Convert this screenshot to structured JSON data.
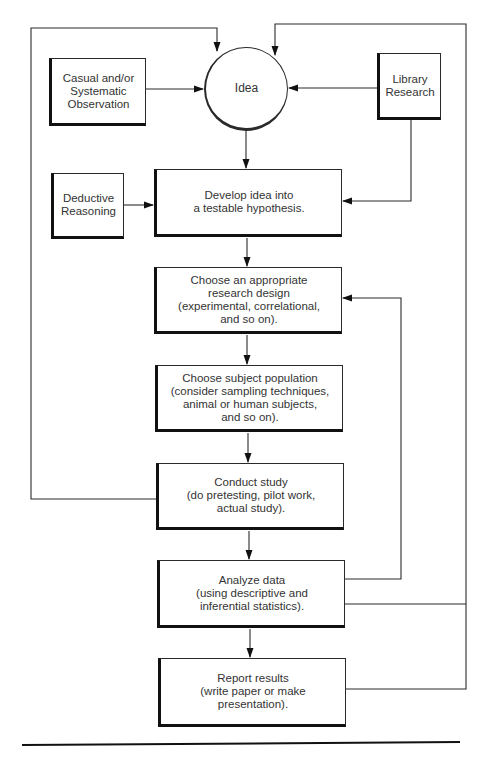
{
  "diagram": {
    "nodes": {
      "observation": {
        "label": "Casual and/or\nSystematic\nObservation"
      },
      "idea": {
        "label": "Idea"
      },
      "library": {
        "label": "Library\nResearch"
      },
      "deductive": {
        "label": "Deductive\nReasoning"
      },
      "hypothesis": {
        "label": "Develop idea into\na testable hypothesis."
      },
      "design": {
        "label": "Choose an appropriate\nresearch design\n(experimental, correlational,\nand so on)."
      },
      "population": {
        "label": "Choose subject population\n(consider sampling techniques,\nanimal or human subjects,\nand so on)."
      },
      "conduct": {
        "label": "Conduct study\n(do pretesting, pilot work,\nactual study)."
      },
      "analyze": {
        "label": "Analyze data\n(using descriptive and\ninferential statistics)."
      },
      "report": {
        "label": "Report results\n(write paper or make\npresentation)."
      }
    },
    "edges": [
      {
        "from": "observation",
        "to": "idea"
      },
      {
        "from": "library",
        "to": "idea"
      },
      {
        "from": "idea",
        "to": "hypothesis"
      },
      {
        "from": "library",
        "to": "hypothesis"
      },
      {
        "from": "deductive",
        "to": "hypothesis"
      },
      {
        "from": "hypothesis",
        "to": "design"
      },
      {
        "from": "design",
        "to": "population"
      },
      {
        "from": "population",
        "to": "conduct"
      },
      {
        "from": "conduct",
        "to": "analyze"
      },
      {
        "from": "analyze",
        "to": "report"
      },
      {
        "from": "conduct",
        "to": "idea"
      },
      {
        "from": "analyze",
        "to": "design"
      },
      {
        "from": "analyze",
        "to": "idea"
      },
      {
        "from": "report",
        "to": "idea"
      }
    ],
    "colors": {
      "line": "#2a2a2a",
      "text": "#333333",
      "background": "#ffffff"
    }
  }
}
